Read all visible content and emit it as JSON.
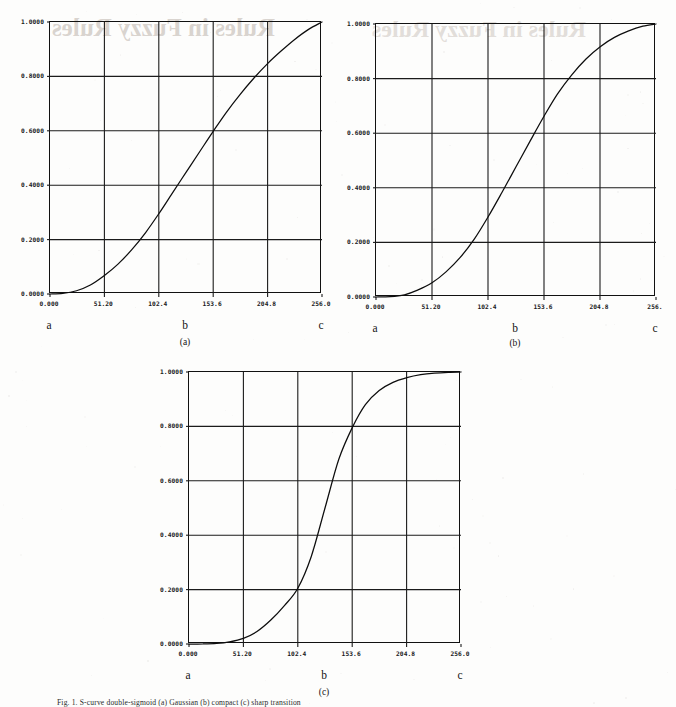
{
  "page": {
    "bleed_through_text": "Rules in Fuzzy Rules",
    "figure_caption": "Fig. 1.   S-curve double-sigmoid (a) Gaussian (b) compact (c) sharp transition"
  },
  "chart_data": [
    {
      "type": "line",
      "title": "(a)",
      "subcaption": "(a)",
      "xlabel": "",
      "ylabel": "",
      "xlim": [
        0,
        256
      ],
      "ylim": [
        0,
        1
      ],
      "grid": true,
      "legend": "none",
      "xticklabels": [
        "0.000",
        "51.20",
        "102.4",
        "153.6",
        "204.8",
        "256.0"
      ],
      "xtickvalues": [
        0,
        51.2,
        102.4,
        153.6,
        204.8,
        256.0
      ],
      "yticklabels": [
        "0.0000",
        "0.2000",
        "0.4000",
        "0.6000",
        "0.8000",
        "1.0000"
      ],
      "ytickvalues": [
        0,
        0.2,
        0.4,
        0.6,
        0.8,
        1.0
      ],
      "annotations": [
        {
          "label": "a",
          "x": 0
        },
        {
          "label": "b",
          "x": 128
        },
        {
          "label": "c",
          "x": 256
        }
      ],
      "series": [
        {
          "name": "membership",
          "x": [
            0,
            12,
            25,
            38,
            51.2,
            64,
            77,
            90,
            102.4,
            115,
            128,
            141,
            153.6,
            166,
            179,
            192,
            205,
            218,
            230,
            243,
            256
          ],
          "values": [
            0.0,
            0.002,
            0.012,
            0.033,
            0.068,
            0.11,
            0.163,
            0.226,
            0.295,
            0.37,
            0.447,
            0.524,
            0.598,
            0.668,
            0.734,
            0.794,
            0.848,
            0.895,
            0.935,
            0.972,
            1.0
          ]
        }
      ]
    },
    {
      "type": "line",
      "title": "(b)",
      "subcaption": "(b)",
      "xlabel": "",
      "ylabel": "",
      "xlim": [
        0,
        256
      ],
      "ylim": [
        0,
        1
      ],
      "grid": true,
      "legend": "none",
      "xticklabels": [
        "0.000",
        "51.20",
        "102.4",
        "153.6",
        "204.8",
        "256."
      ],
      "xtickvalues": [
        0,
        51.2,
        102.4,
        153.6,
        204.8,
        256.0
      ],
      "yticklabels": [
        "0.0000",
        "0.2000",
        "0.4000",
        "0.6000",
        "0.8000",
        "1.0000"
      ],
      "ytickvalues": [
        0,
        0.2,
        0.4,
        0.6,
        0.8,
        1.0
      ],
      "annotations": [
        {
          "label": "a",
          "x": 0
        },
        {
          "label": "b",
          "x": 128
        },
        {
          "label": "c",
          "x": 256
        }
      ],
      "series": [
        {
          "name": "membership",
          "x": [
            0,
            13,
            26,
            38,
            51.2,
            64,
            77,
            90,
            102.4,
            115,
            128,
            141,
            153.6,
            166,
            179,
            192,
            205,
            218,
            231,
            244,
            256
          ],
          "values": [
            0.0,
            0.001,
            0.008,
            0.025,
            0.052,
            0.092,
            0.145,
            0.213,
            0.293,
            0.382,
            0.477,
            0.572,
            0.662,
            0.744,
            0.814,
            0.872,
            0.917,
            0.951,
            0.975,
            0.992,
            1.0
          ]
        }
      ]
    },
    {
      "type": "line",
      "title": "(c)",
      "subcaption": "(c)",
      "xlabel": "",
      "ylabel": "",
      "xlim": [
        0,
        256
      ],
      "ylim": [
        0,
        1
      ],
      "grid": true,
      "legend": "none",
      "xticklabels": [
        "0.000",
        "51.20",
        "102.4",
        "153.6",
        "204.8",
        "256.0"
      ],
      "xtickvalues": [
        0,
        51.2,
        102.4,
        153.6,
        204.8,
        256.0
      ],
      "yticklabels": [
        "0.0000",
        "0.2000",
        "0.4000",
        "0.6000",
        "0.8000",
        "1.0000"
      ],
      "ytickvalues": [
        0,
        0.2,
        0.4,
        0.6,
        0.8,
        1.0
      ],
      "annotations": [
        {
          "label": "a",
          "x": 0
        },
        {
          "label": "b",
          "x": 128
        },
        {
          "label": "c",
          "x": 256
        }
      ],
      "series": [
        {
          "name": "membership",
          "x": [
            0,
            13,
            26,
            38,
            51.2,
            64,
            77,
            90,
            102.4,
            115,
            128,
            141,
            153.6,
            166,
            179,
            192,
            205,
            218,
            231,
            244,
            256
          ],
          "values": [
            0.0,
            0.0,
            0.002,
            0.008,
            0.021,
            0.046,
            0.088,
            0.142,
            0.205,
            0.321,
            0.5,
            0.679,
            0.795,
            0.88,
            0.932,
            0.962,
            0.979,
            0.99,
            0.996,
            0.999,
            1.0
          ]
        }
      ]
    }
  ]
}
